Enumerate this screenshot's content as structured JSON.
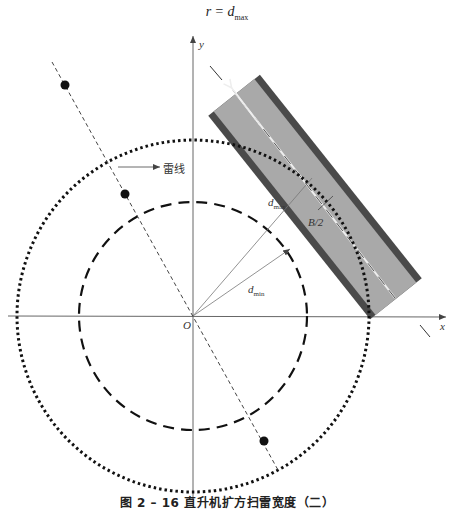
{
  "figure": {
    "formula": {
      "lhs": "r = d",
      "sub": "max"
    },
    "caption": "图 2 – 16   直升机扩方扫雷宽度（二）",
    "axes": {
      "x_label": "x",
      "y_label": "y",
      "origin_label": "O"
    },
    "labels": {
      "mine_line": "雷线",
      "d_max": {
        "main": "d",
        "sub": "max"
      },
      "d_min": {
        "main": "d",
        "sub": "min"
      },
      "half_width": "B/2"
    },
    "geometry": {
      "origin": [
        193,
        316
      ],
      "outer_circle_radius": 176,
      "inner_circle_radius": 114,
      "mine_points": [
        [
          65,
          85
        ],
        [
          125,
          194
        ],
        [
          264,
          441
        ]
      ]
    },
    "colors": {
      "band_fill": "#a8a8a8",
      "band_edge": "#4a4a4a",
      "line": "#222222",
      "axis": "#555555"
    }
  }
}
